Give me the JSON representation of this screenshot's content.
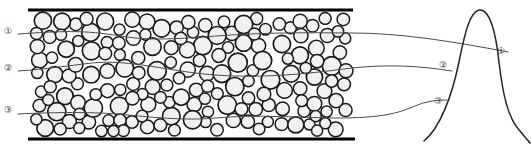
{
  "figure": {
    "title": "",
    "type": "granular-packing-schematic",
    "background_color": "#ffffff",
    "boundary_color": "#000000",
    "grain_outline_color": "#1a1a1a",
    "grain_fill_color": "#f2f2f2",
    "trace_color": "#4d4d4d",
    "peak_curve_color": "#262626",
    "label_color": "#3a3a3a"
  },
  "labels": {
    "left": [
      {
        "id": "left-label-1",
        "text": "①",
        "x": 4,
        "y": 27
      },
      {
        "id": "left-label-2",
        "text": "②",
        "x": 4,
        "y": 64
      },
      {
        "id": "left-label-3",
        "text": "③",
        "x": 4,
        "y": 106
      }
    ],
    "right": [
      {
        "id": "right-label-1",
        "text": "①",
        "x": 497,
        "y": 47
      },
      {
        "id": "right-label-2",
        "text": "②",
        "x": 439,
        "y": 61
      },
      {
        "id": "right-label-3",
        "text": "③",
        "x": 434,
        "y": 97
      }
    ]
  },
  "boundaries": {
    "top": {
      "x1": 28,
      "y1": 10,
      "x2": 353,
      "y2": 10,
      "width": 3
    },
    "bottom": {
      "x1": 28,
      "y1": 139,
      "x2": 355,
      "y2": 139,
      "width": 3
    }
  },
  "traces": [
    {
      "name": "trace-1",
      "path": "M 18 34 C 60 31, 86 30, 120 36 C 160 43, 200 36, 250 34 C 300 32, 330 33, 352 33 C 400 33, 450 41, 508 52"
    },
    {
      "name": "trace-2",
      "path": "M 18 71 C 48 69, 66 66, 92 63 C 130 59, 172 72, 215 75 C 270 79, 320 72, 352 68 C 390 64, 420 66, 452 71"
    },
    {
      "name": "trace-3",
      "path": "M 18 114 C 60 112, 88 112, 118 114 C 150 117, 185 121, 215 118 C 260 114, 300 118, 340 118 C 375 118, 396 114, 410 108 C 422 103, 430 100, 447 100"
    }
  ],
  "peak_curve": {
    "name": "peak-curve",
    "path": "M 424 141 C 440 128, 452 96, 459 62 C 465 32, 470 12, 479 10 C 490 8, 496 34, 499 62 C 503 96, 508 118, 520 131 C 524 136, 527 139, 530 143",
    "apex_x": 479,
    "apex_y": 10
  },
  "grains": {
    "count": 196,
    "radius_min": 5.5,
    "radius_max": 9.5,
    "region": {
      "x1": 30,
      "y1": 12,
      "x2": 353,
      "y2": 137
    }
  }
}
